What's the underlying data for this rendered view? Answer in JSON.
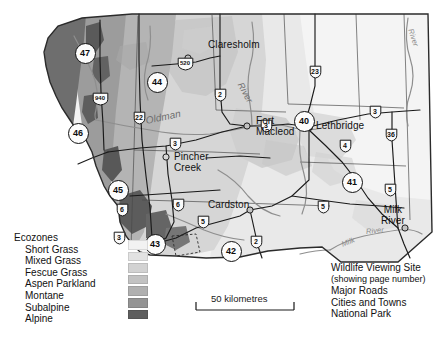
{
  "map": {
    "title": "Southern Alberta Ecozones and Wildlife Viewing Sites",
    "cities": [
      {
        "name": "Claresholm",
        "x": 215,
        "y": 44,
        "dot_x": 188,
        "dot_y": 58
      },
      {
        "name": "Fort",
        "name2": "Macleod",
        "x": 240,
        "y": 118,
        "dot_x": 247,
        "dot_y": 126
      },
      {
        "name": "Lethbridge",
        "x": 316,
        "y": 123,
        "dot_x": 309,
        "dot_y": 127
      },
      {
        "name": "Pincher",
        "name2": "Creek",
        "x": 172,
        "y": 158,
        "dot_x": 166,
        "dot_y": 157
      },
      {
        "name": "Cardston",
        "x": 212,
        "y": 205,
        "dot_x": 250,
        "dot_y": 210
      },
      {
        "name": "Milk",
        "name2": "River",
        "x": 386,
        "y": 212,
        "dot_x": 405,
        "dot_y": 228
      }
    ],
    "rivers": [
      {
        "label": "Oldman",
        "x": 152,
        "y": 123,
        "rot": -12,
        "size": 10
      },
      {
        "label": "River",
        "x": 246,
        "y": 85,
        "rot": 62,
        "size": 9
      },
      {
        "label": "River",
        "x": 413,
        "y": 32,
        "rot": 72,
        "size": 8
      },
      {
        "label": "River",
        "x": 372,
        "y": 231,
        "rot": -6,
        "size": 7.5
      },
      {
        "label": "Milk",
        "x": 347,
        "y": 243,
        "rot": -22,
        "size": 7.5
      }
    ],
    "viewing_sites": [
      {
        "number": "47",
        "x": 84,
        "y": 52
      },
      {
        "number": "44",
        "x": 156,
        "y": 81
      },
      {
        "number": "46",
        "x": 77,
        "y": 132
      },
      {
        "number": "40",
        "x": 303,
        "y": 120
      },
      {
        "number": "45",
        "x": 117,
        "y": 189
      },
      {
        "number": "41",
        "x": 351,
        "y": 181
      },
      {
        "number": "43",
        "x": 154,
        "y": 243
      },
      {
        "number": "42",
        "x": 230,
        "y": 250
      }
    ],
    "highway_shields": [
      {
        "number": "940",
        "x": 100,
        "y": 99
      },
      {
        "number": "520",
        "x": 185,
        "y": 64
      },
      {
        "number": "22",
        "x": 139,
        "y": 118
      },
      {
        "number": "2",
        "x": 220,
        "y": 95
      },
      {
        "number": "23",
        "x": 315,
        "y": 72
      },
      {
        "number": "3",
        "x": 266,
        "y": 126
      },
      {
        "number": "3",
        "x": 175,
        "y": 144
      },
      {
        "number": "6",
        "x": 178,
        "y": 205
      },
      {
        "number": "6",
        "x": 122,
        "y": 210
      },
      {
        "number": "5",
        "x": 203,
        "y": 222
      },
      {
        "number": "2",
        "x": 256,
        "y": 242
      },
      {
        "number": "5",
        "x": 323,
        "y": 207
      },
      {
        "number": "4",
        "x": 345,
        "y": 146
      },
      {
        "number": "3",
        "x": 375,
        "y": 112
      },
      {
        "number": "36",
        "x": 391,
        "y": 135
      },
      {
        "number": "5",
        "x": 390,
        "y": 190
      },
      {
        "number": "3",
        "x": 119,
        "y": 238
      }
    ],
    "ecozone_legend": {
      "title": "Ecozones",
      "items": [
        {
          "label": "Short Grass",
          "color": "#f2f2f2"
        },
        {
          "label": "Mixed Grass",
          "color": "#e2e2e2"
        },
        {
          "label": "Fescue Grass",
          "color": "#d2d2d2"
        },
        {
          "label": "Aspen Parkland",
          "color": "#c2c2c2"
        },
        {
          "label": "Montane",
          "color": "#b0b0b0"
        },
        {
          "label": "Subalpine",
          "color": "#949494"
        },
        {
          "label": "Alpine",
          "color": "#5e5e5e"
        }
      ]
    },
    "symbol_legend": {
      "items": [
        {
          "label": "Wildlife Viewing Site"
        },
        {
          "label": "(showing page number)"
        },
        {
          "label": "Major Roads"
        },
        {
          "label": "Cities and Towns"
        },
        {
          "label": "National Park"
        }
      ]
    },
    "scale": {
      "label": "50 kilometres"
    },
    "colors": {
      "short_grass": "#f2f2f2",
      "mixed_grass": "#e2e2e2",
      "fescue_grass": "#d2d2d2",
      "aspen_parkland": "#c2c2c2",
      "montane": "#b0b0b0",
      "subalpine": "#949494",
      "alpine": "#5e5e5e",
      "frame": "#2b2b2b",
      "road": "#1a1a1a",
      "river": "#8e8e8e",
      "page_bg": "#ffffff"
    }
  }
}
